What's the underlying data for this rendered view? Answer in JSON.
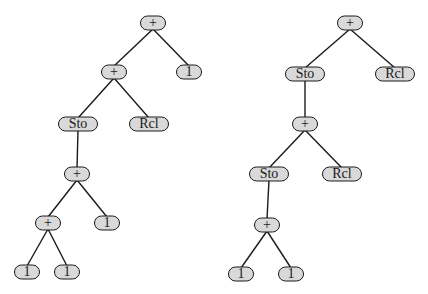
{
  "diagram": {
    "type": "expression-trees",
    "colors": {
      "node_fill": "#d9d9d9",
      "node_border": "#1a1a1a",
      "edge": "#1a1a1a",
      "background": "#ffffff"
    },
    "trees": [
      {
        "name": "left-tree",
        "nodes": [
          {
            "id": "L0",
            "label": "+",
            "x": 153,
            "y": 23,
            "w": 26
          },
          {
            "id": "L1",
            "label": "+",
            "x": 114,
            "y": 72,
            "w": 26
          },
          {
            "id": "L2",
            "label": "1",
            "x": 189,
            "y": 72,
            "w": 26
          },
          {
            "id": "L3",
            "label": "Sto",
            "x": 78,
            "y": 124,
            "w": 40
          },
          {
            "id": "L4",
            "label": "Rcl",
            "x": 149,
            "y": 124,
            "w": 40
          },
          {
            "id": "L5",
            "label": "+",
            "x": 77,
            "y": 174,
            "w": 26
          },
          {
            "id": "L6",
            "label": "+",
            "x": 48,
            "y": 223,
            "w": 26
          },
          {
            "id": "L7",
            "label": "1",
            "x": 107,
            "y": 223,
            "w": 26
          },
          {
            "id": "L8",
            "label": "1",
            "x": 27,
            "y": 272,
            "w": 26
          },
          {
            "id": "L9",
            "label": "1",
            "x": 67,
            "y": 272,
            "w": 26
          }
        ],
        "edges": [
          [
            "L0",
            "L1"
          ],
          [
            "L0",
            "L2"
          ],
          [
            "L1",
            "L3"
          ],
          [
            "L1",
            "L4"
          ],
          [
            "L3",
            "L5"
          ],
          [
            "L5",
            "L6"
          ],
          [
            "L5",
            "L7"
          ],
          [
            "L6",
            "L8"
          ],
          [
            "L6",
            "L9"
          ]
        ]
      },
      {
        "name": "right-tree",
        "nodes": [
          {
            "id": "R0",
            "label": "+",
            "x": 350,
            "y": 23,
            "w": 26
          },
          {
            "id": "R1",
            "label": "Sto",
            "x": 305,
            "y": 74,
            "w": 40
          },
          {
            "id": "R2",
            "label": "Rcl",
            "x": 395,
            "y": 74,
            "w": 40
          },
          {
            "id": "R3",
            "label": "+",
            "x": 305,
            "y": 124,
            "w": 26
          },
          {
            "id": "R4",
            "label": "Sto",
            "x": 269,
            "y": 174,
            "w": 40
          },
          {
            "id": "R5",
            "label": "Rcl",
            "x": 342,
            "y": 174,
            "w": 40
          },
          {
            "id": "R6",
            "label": "+",
            "x": 267,
            "y": 225,
            "w": 26
          },
          {
            "id": "R7",
            "label": "1",
            "x": 241,
            "y": 274,
            "w": 26
          },
          {
            "id": "R8",
            "label": "1",
            "x": 291,
            "y": 274,
            "w": 26
          }
        ],
        "edges": [
          [
            "R0",
            "R1"
          ],
          [
            "R0",
            "R2"
          ],
          [
            "R1",
            "R3"
          ],
          [
            "R3",
            "R4"
          ],
          [
            "R3",
            "R5"
          ],
          [
            "R4",
            "R6"
          ],
          [
            "R6",
            "R7"
          ],
          [
            "R6",
            "R8"
          ]
        ]
      }
    ]
  }
}
